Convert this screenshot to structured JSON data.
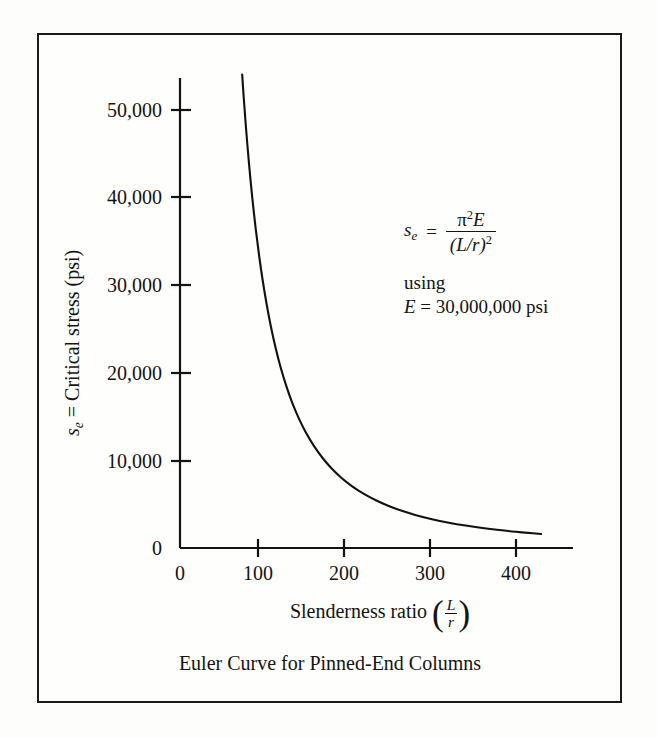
{
  "figure": {
    "caption": "Euler Curve for Pinned-End Columns",
    "border_color": "#1a1a1a",
    "paper_color": "#fdfdfb",
    "ink_color": "#131313"
  },
  "annotation": {
    "lhs_symbol": "s",
    "lhs_subscript": "e",
    "equals": "=",
    "numerator_pi": "π",
    "numerator_pi_exp": "2",
    "numerator_E": "E",
    "denominator": "(L/r)",
    "denominator_exp": "2",
    "using_label": "using",
    "modulus_symbol": "E",
    "modulus_equals": "=",
    "modulus_value": "30,000,000 psi"
  },
  "chart_data": {
    "type": "line",
    "title": "Euler Curve for Pinned-End Columns",
    "xlabel": "Slenderness ratio (L/r)",
    "ylabel": "s_e = Critical stress (psi)",
    "ylabel_symbol": "s",
    "ylabel_subscript": "e",
    "ylabel_rest": "= Critical stress (psi)",
    "xlabel_text": "Slenderness ratio",
    "xlabel_num": "L",
    "xlabel_den": "r",
    "xlim": [
      0,
      455
    ],
    "ylim": [
      0,
      55000
    ],
    "xticks": [
      0,
      100,
      200,
      300,
      400
    ],
    "xtick_labels": [
      "0",
      "100",
      "200",
      "300",
      "400"
    ],
    "yticks": [
      0,
      10000,
      20000,
      30000,
      40000,
      50000
    ],
    "ytick_labels": [
      "0",
      "10,000",
      "20,000",
      "30,000",
      "40,000",
      "50,000"
    ],
    "grid": false,
    "legend": false,
    "equation": "s_e = pi^2 * E / (L/r)^2",
    "E_modulus": 30000000,
    "series": [
      {
        "name": "Euler critical stress",
        "color": "#111111",
        "x": [
          74,
          76,
          78,
          80,
          83,
          86,
          90,
          94,
          98,
          103,
          108,
          114,
          120,
          127,
          134,
          142,
          150,
          160,
          170,
          180,
          192,
          205,
          220,
          235,
          250,
          265,
          280,
          300,
          320,
          340,
          360,
          380,
          400,
          420,
          430
        ],
        "y": [
          54060,
          51259,
          48670,
          46260,
          42986,
          40037,
          36549,
          33504,
          30825,
          27910,
          25377,
          22780,
          20553,
          18357,
          16475,
          14682,
          13159,
          11564,
          10244,
          9139,
          8029,
          7045,
          6117,
          5362,
          4738,
          4215,
          3776,
          3290,
          2892,
          2561,
          2284,
          2050,
          1850,
          1678,
          1602
        ]
      }
    ]
  },
  "axes": {
    "y_axis_label_parts": [
      "s",
      "e",
      "=",
      "Critical stress (psi)"
    ],
    "x_axis_label_prefix": "Slenderness ratio"
  }
}
